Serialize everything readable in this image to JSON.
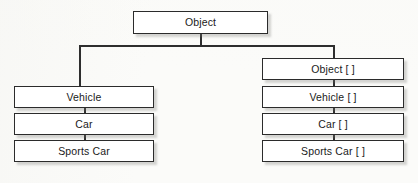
{
  "diagram": {
    "type": "tree",
    "background_color": "#fbfbf9",
    "node_fill": "#ffffff",
    "node_border_color": "#2b2b2b",
    "edge_color": "#2e2e2e",
    "root": {
      "id": "object",
      "label": "Object",
      "x": 133,
      "y": 11,
      "width": 135,
      "height": 23
    },
    "branches": [
      {
        "id": "scalar-branch",
        "nodes": [
          {
            "id": "vehicle",
            "label": "Vehicle",
            "x": 14,
            "y": 86,
            "width": 140,
            "height": 22
          },
          {
            "id": "car",
            "label": "Car",
            "x": 14,
            "y": 113,
            "width": 140,
            "height": 22
          },
          {
            "id": "sports-car",
            "label": "Sports Car",
            "x": 14,
            "y": 140,
            "width": 140,
            "height": 22
          }
        ]
      },
      {
        "id": "array-branch",
        "nodes": [
          {
            "id": "object-array",
            "label": "Object [ ]",
            "x": 262,
            "y": 58,
            "width": 142,
            "height": 22
          },
          {
            "id": "vehicle-array",
            "label": "Vehicle [ ]",
            "x": 262,
            "y": 86,
            "width": 142,
            "height": 22
          },
          {
            "id": "car-array",
            "label": "Car [ ]",
            "x": 262,
            "y": 113,
            "width": 142,
            "height": 22
          },
          {
            "id": "sports-car-array",
            "label": "Sports Car [ ]",
            "x": 262,
            "y": 140,
            "width": 142,
            "height": 22
          }
        ]
      }
    ],
    "edges": {
      "root_stem": {
        "x": 200,
        "y": 34,
        "height": 12
      },
      "split_bar": {
        "x": 79,
        "y": 45,
        "width": 255
      },
      "left_drop": {
        "x": 79,
        "y": 45,
        "height": 41
      },
      "right_drop": {
        "x": 333,
        "y": 45,
        "height": 13
      },
      "left_link_1": {
        "x": 84,
        "y": 108,
        "height": 5
      },
      "left_link_2": {
        "x": 84,
        "y": 135,
        "height": 5
      },
      "right_link_1": {
        "x": 333,
        "y": 80,
        "height": 6
      },
      "right_link_2": {
        "x": 333,
        "y": 108,
        "height": 5
      },
      "right_link_3": {
        "x": 333,
        "y": 135,
        "height": 5
      }
    }
  }
}
